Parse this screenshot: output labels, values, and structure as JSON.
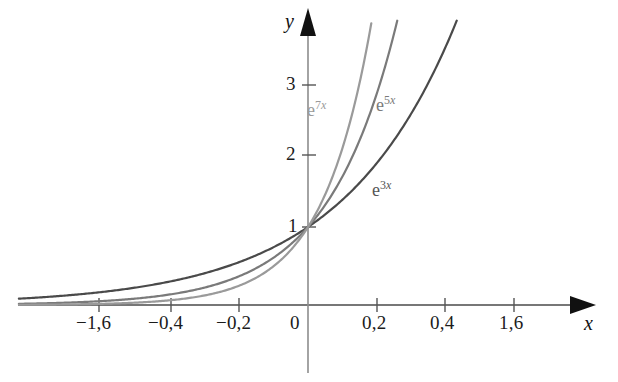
{
  "figure": {
    "background_color": "#ffffff",
    "width": 618,
    "height": 382
  },
  "axes": {
    "x_axis_label": "x",
    "y_axis_label": "y",
    "x_origin_px": 308,
    "y_origin_px": 305,
    "x_ticks": [
      {
        "label": "−1,6",
        "px": 99
      },
      {
        "label": "−0,4",
        "px": 171
      },
      {
        "label": "−0,2",
        "px": 239
      },
      {
        "label": "0",
        "px": 308
      },
      {
        "label": "0,2",
        "px": 377
      },
      {
        "label": "0,4",
        "px": 445
      },
      {
        "label": "1,6",
        "px": 514
      }
    ],
    "y_ticks": [
      {
        "label": "1",
        "px": 227
      },
      {
        "label": "2",
        "px": 155
      },
      {
        "label": "3",
        "px": 85
      }
    ]
  },
  "curve_labels": [
    {
      "name": "e7x",
      "base": "e",
      "coefficient": "7",
      "variable": "x",
      "color": "#9a9a9a",
      "left": 307,
      "top": 98
    },
    {
      "name": "e5x",
      "base": "e",
      "coefficient": "5",
      "variable": "x",
      "color": "#7a7a7a",
      "left": 376,
      "top": 93
    },
    {
      "name": "e3x",
      "base": "e",
      "coefficient": "3",
      "variable": "x",
      "color": "#555555",
      "left": 372,
      "top": 178
    }
  ],
  "chart_data": {
    "type": "line",
    "title": "",
    "xlabel": "x",
    "ylabel": "y",
    "xlim": [
      -1.8,
      2.0
    ],
    "ylim": [
      -0.1,
      3.8
    ],
    "grid": false,
    "legend": "inline-curve-labels",
    "x_tick_labels": [
      "−1,6",
      "−0,4",
      "−0,2",
      "0",
      "0,2",
      "0,4",
      "1,6"
    ],
    "y_tick_labels": [
      "1",
      "2",
      "3"
    ],
    "decimal_separator": ",",
    "series": [
      {
        "name": "e^{3x}",
        "label": "e 3x",
        "color": "#4a4a4a",
        "width": 2.2,
        "growth_rate": 3,
        "x": [
          -1.7,
          -1.5,
          -1.25,
          -1.0,
          -0.75,
          -0.5,
          -0.4,
          -0.3,
          -0.2,
          -0.1,
          0.0,
          0.1,
          0.2,
          0.3,
          0.4,
          0.45,
          0.5
        ],
        "values": [
          0.006,
          0.011,
          0.024,
          0.05,
          0.105,
          0.223,
          0.301,
          0.407,
          0.549,
          0.741,
          1.0,
          1.35,
          1.822,
          2.46,
          3.32,
          3.857,
          4.482
        ]
      },
      {
        "name": "e^{5x}",
        "label": "e 5x",
        "color": "#7a7a7a",
        "width": 2.2,
        "growth_rate": 5,
        "x": [
          -1.7,
          -1.5,
          -1.25,
          -1.0,
          -0.75,
          -0.5,
          -0.4,
          -0.3,
          -0.2,
          -0.1,
          0.0,
          0.05,
          0.1,
          0.15,
          0.2,
          0.25,
          0.3
        ],
        "values": [
          0.0002,
          0.0006,
          0.0019,
          0.0067,
          0.0235,
          0.082,
          0.135,
          0.223,
          0.368,
          0.607,
          1.0,
          1.284,
          1.649,
          2.117,
          2.718,
          3.49,
          4.482
        ]
      },
      {
        "name": "e^{7x}",
        "label": "e 7x",
        "color": "#9a9a9a",
        "width": 2.2,
        "growth_rate": 7,
        "x": [
          -1.7,
          -1.5,
          -1.25,
          -1.0,
          -0.75,
          -0.5,
          -0.4,
          -0.3,
          -0.2,
          -0.1,
          0.0,
          0.05,
          0.1,
          0.15,
          0.2,
          0.215
        ],
        "values": [
          6.9e-06,
          2.8e-05,
          0.00016,
          0.0009,
          0.0052,
          0.0302,
          0.0608,
          0.1225,
          0.2466,
          0.4966,
          1.0,
          1.419,
          2.014,
          2.858,
          4.055,
          4.48
        ]
      }
    ]
  }
}
